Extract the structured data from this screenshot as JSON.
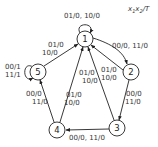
{
  "legend": {
    "x1": "x",
    "sub1": "1",
    "x2": "x",
    "sub2": "2",
    "suffix": "/T"
  },
  "nodes": [
    {
      "id": "1",
      "label": "1"
    },
    {
      "id": "2",
      "label": "2"
    },
    {
      "id": "3",
      "label": "3"
    },
    {
      "id": "4",
      "label": "4"
    },
    {
      "id": "5",
      "label": "5"
    }
  ],
  "edges": [
    {
      "from": "1",
      "to": "1",
      "labels": [
        "01/0, 10/0"
      ]
    },
    {
      "from": "1",
      "to": "2",
      "labels": [
        "00/0, 11/0"
      ]
    },
    {
      "from": "2",
      "to": "1",
      "labels": [
        "01/0",
        "10/0"
      ]
    },
    {
      "from": "2",
      "to": "3",
      "labels": [
        "00/0",
        "11/0"
      ]
    },
    {
      "from": "3",
      "to": "1",
      "labels": [
        "01/0",
        "10/0"
      ]
    },
    {
      "from": "3",
      "to": "4",
      "labels": [
        "00/0, 11/0"
      ]
    },
    {
      "from": "4",
      "to": "1",
      "labels": [
        "01/0",
        "10/0"
      ]
    },
    {
      "from": "4",
      "to": "5",
      "labels": [
        "00/0",
        "11/0"
      ]
    },
    {
      "from": "5",
      "to": "1",
      "labels": [
        "01/0",
        "10/0"
      ]
    },
    {
      "from": "5",
      "to": "5",
      "labels": [
        "00/1",
        "11/1"
      ]
    }
  ]
}
